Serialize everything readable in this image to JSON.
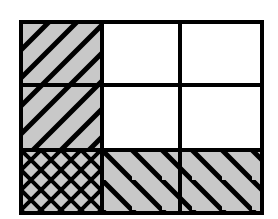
{
  "figure": {
    "kind": "hatched-grid-diagram",
    "title": "",
    "canvas": {
      "width": 278,
      "height": 219,
      "background": "#ffffff"
    },
    "plot_area": {
      "x": 21,
      "y": 22,
      "width": 241,
      "height": 191
    },
    "border": {
      "color": "#000000",
      "width": 4
    },
    "grid": {
      "rows": 3,
      "columns": 3,
      "line_color": "#000000",
      "line_width": 4,
      "column_edges": [
        21,
        102,
        180,
        262
      ],
      "row_edges": [
        22,
        85,
        150,
        213
      ]
    },
    "fills": {
      "gray": "#c8c8c8",
      "white": "#ffffff",
      "hatch_color": "#000000"
    },
    "hatch_styles": {
      "forward_diagonal": {
        "name": "forward-diagonal",
        "angle_deg": 45,
        "spacing": 28,
        "stroke_width": 5
      },
      "backward_diagonal": {
        "name": "backward-diagonal",
        "angle_deg": -45,
        "spacing": 30,
        "stroke_width": 5
      },
      "cross_hatch": {
        "name": "cross-hatch",
        "angle_deg": 45,
        "spacing": 20,
        "stroke_width": 4
      },
      "none": {
        "name": "none",
        "angle_deg": 0,
        "spacing": 0,
        "stroke_width": 0
      }
    },
    "cells": [
      {
        "id": "r1c1",
        "row": 1,
        "column": 1,
        "label": "",
        "fill": "gray",
        "hatch": "forward-diagonal",
        "x": 21,
        "y": 22,
        "width": 81,
        "height": 63
      },
      {
        "id": "r1c2",
        "row": 1,
        "column": 2,
        "label": "",
        "fill": "white",
        "hatch": "none",
        "x": 102,
        "y": 22,
        "width": 78,
        "height": 63
      },
      {
        "id": "r1c3",
        "row": 1,
        "column": 3,
        "label": "",
        "fill": "white",
        "hatch": "none",
        "x": 180,
        "y": 22,
        "width": 82,
        "height": 63
      },
      {
        "id": "r2c1",
        "row": 2,
        "column": 1,
        "label": "",
        "fill": "gray",
        "hatch": "forward-diagonal",
        "x": 21,
        "y": 85,
        "width": 81,
        "height": 65
      },
      {
        "id": "r2c2",
        "row": 2,
        "column": 2,
        "label": "",
        "fill": "white",
        "hatch": "none",
        "x": 102,
        "y": 85,
        "width": 78,
        "height": 65
      },
      {
        "id": "r2c3",
        "row": 2,
        "column": 3,
        "label": "",
        "fill": "white",
        "hatch": "none",
        "x": 180,
        "y": 85,
        "width": 82,
        "height": 65
      },
      {
        "id": "r3c1",
        "row": 3,
        "column": 1,
        "label": "",
        "fill": "gray",
        "hatch": "cross-hatch",
        "x": 21,
        "y": 150,
        "width": 81,
        "height": 63
      },
      {
        "id": "r3c2",
        "row": 3,
        "column": 2,
        "label": "",
        "fill": "gray",
        "hatch": "backward-diagonal",
        "x": 102,
        "y": 150,
        "width": 78,
        "height": 63
      },
      {
        "id": "r3c3",
        "row": 3,
        "column": 3,
        "label": "",
        "fill": "gray",
        "hatch": "backward-diagonal",
        "x": 180,
        "y": 150,
        "width": 82,
        "height": 63
      }
    ]
  }
}
